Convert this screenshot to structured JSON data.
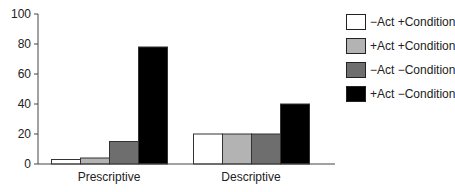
{
  "chart_data": {
    "type": "bar",
    "title": "",
    "xlabel": "",
    "ylabel": "",
    "ylim": [
      0,
      100
    ],
    "yticks": [
      0,
      20,
      40,
      60,
      80,
      100
    ],
    "grid": false,
    "legend_position": "upper right",
    "categories": [
      "Prescriptive",
      "Descriptive"
    ],
    "series": [
      {
        "name": "−Act +Condition",
        "color": "#ffffff",
        "values": [
          3,
          20
        ]
      },
      {
        "name": "+Act +Condition",
        "color": "#b3b3b3",
        "values": [
          4,
          20
        ]
      },
      {
        "name": "−Act −Condition",
        "color": "#6e6e6e",
        "values": [
          15,
          20
        ]
      },
      {
        "name": "+Act −Condition",
        "color": "#000000",
        "values": [
          78,
          40
        ]
      }
    ]
  }
}
